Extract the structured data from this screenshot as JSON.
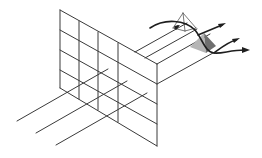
{
  "figure": {
    "colors": {
      "line": "#3a3a3a",
      "arrow": "#1e1e1e",
      "pyramid_dark": "#6f6f6f",
      "pyramid_light": "#b5b5b5",
      "background": "#ffffff"
    },
    "grid": {
      "columns": 5,
      "rows": 4
    },
    "elements": [
      "grid-panel",
      "receding-rays",
      "outline-pyramid",
      "shaded-wedge",
      "curved-arrows"
    ]
  }
}
